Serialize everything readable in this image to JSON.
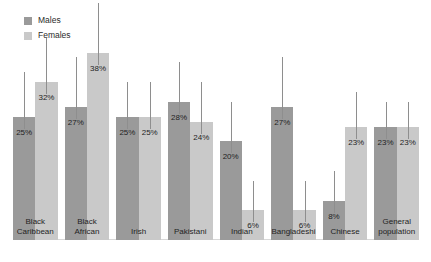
{
  "legend": {
    "items": [
      {
        "label": "Males",
        "color": "#9a9a9a",
        "icon": "square-swatch-icon"
      },
      {
        "label": "Females",
        "color": "#c9c9c9",
        "icon": "square-swatch-icon"
      }
    ]
  },
  "colors": {
    "males": "#9a9a9a",
    "females": "#c9c9c9",
    "whisker": "#8e8e8e",
    "label_text": "#1f1f1f",
    "background": "#ffffff",
    "baseline": "#d8d8d8"
  },
  "chart_data": {
    "type": "bar",
    "title": "",
    "subtitle": "",
    "xlabel": "",
    "ylabel": "",
    "ylim": [
      0,
      45
    ],
    "grid": false,
    "legend_position": "top-left",
    "error_bars": true,
    "categories": [
      "Black\nCaribbean",
      "Black\nAfrican",
      "Irish",
      "Pakistani",
      "Indian",
      "Bangladeshi",
      "Chinese",
      "General\npopulation"
    ],
    "series": [
      {
        "name": "Males",
        "color": "#9a9a9a",
        "values": [
          25,
          27,
          25,
          28,
          20,
          27,
          8,
          23
        ],
        "labels": [
          "25%",
          "27%",
          "25%",
          "28%",
          "20%",
          "27%",
          "8%",
          "23%"
        ],
        "ci_high": [
          34,
          37,
          32,
          36,
          28,
          37,
          14,
          28
        ]
      },
      {
        "name": "Females",
        "color": "#c9c9c9",
        "values": [
          32,
          38,
          25,
          24,
          6,
          6,
          23,
          23
        ],
        "labels": [
          "32%",
          "38%",
          "25%",
          "24%",
          "6%",
          "6%",
          "23%",
          "23%"
        ],
        "ci_high": [
          41,
          48,
          32,
          32,
          12,
          12,
          30,
          28
        ]
      }
    ]
  }
}
